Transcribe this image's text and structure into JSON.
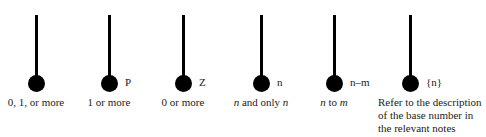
{
  "symbols": [
    {
      "tag": "",
      "caption": "0, 1, or more"
    },
    {
      "tag": "P",
      "caption": "1 or more"
    },
    {
      "tag": "Z",
      "caption": "0 or more"
    },
    {
      "tag": "n",
      "caption_parts": [
        "n",
        " and only ",
        "n"
      ]
    },
    {
      "tag": "n–m",
      "caption_parts": [
        "n",
        " to ",
        "m"
      ]
    },
    {
      "tag": "{n}",
      "caption": "Refer to the description of the base number in the relevant notes"
    }
  ]
}
